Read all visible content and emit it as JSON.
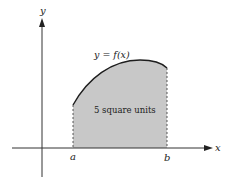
{
  "diagram": {
    "axes": {
      "x_label": "x",
      "y_label": "y"
    },
    "curve_label": "y = f(x)",
    "area_label": "5 square units",
    "bounds": {
      "lower": "a",
      "upper": "b"
    },
    "colors": {
      "fill": "#c8c8c8",
      "stroke": "#1e1e1e",
      "axis": "#333333"
    }
  }
}
